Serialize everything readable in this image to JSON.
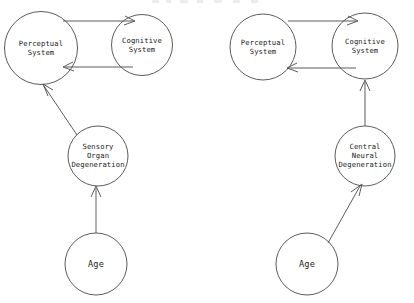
{
  "figure": {
    "type": "diagram",
    "stroke_color": "#4a4a4a",
    "text_color": "#1a1a1a",
    "background_color": "#ffffff"
  },
  "diagrams": [
    {
      "id": "left-model",
      "name": "sensory-organ-degeneration-model",
      "nodes": [
        {
          "id": "left-perceptual",
          "label": "Perceptual\nSystem",
          "cx": 41,
          "cy": 48,
          "r": 36.5,
          "font": "small"
        },
        {
          "id": "left-cognitive",
          "label": "Cognitive\nSystem",
          "cx": 142,
          "cy": 45,
          "r": 30.5,
          "font": "small"
        },
        {
          "id": "left-degeneration",
          "label": "Sensory\nOrgan\nDegeneration",
          "cx": 98,
          "cy": 156,
          "r": 30,
          "font": "small"
        },
        {
          "id": "left-age",
          "label": "Age",
          "cx": 96,
          "cy": 264,
          "r": 31,
          "font": "big"
        }
      ],
      "edges": [
        {
          "id": "left-perceptual-to-cognitive",
          "from": "left-perceptual",
          "to": "left-cognitive",
          "style": "curved",
          "direction": "right"
        },
        {
          "id": "left-cognitive-to-perceptual",
          "from": "left-cognitive",
          "to": "left-perceptual",
          "style": "curved",
          "direction": "left"
        },
        {
          "id": "left-degeneration-to-perceptual",
          "from": "left-degeneration",
          "to": "left-perceptual",
          "style": "diagonal",
          "direction": "up-left"
        },
        {
          "id": "left-age-to-degeneration",
          "from": "left-age",
          "to": "left-degeneration",
          "style": "straight",
          "direction": "up"
        }
      ]
    },
    {
      "id": "right-model",
      "name": "central-neural-degeneration-model",
      "nodes": [
        {
          "id": "right-perceptual",
          "label": "Perceptual\nSystem",
          "cx": 263,
          "cy": 47,
          "r": 33,
          "font": "small"
        },
        {
          "id": "right-cognitive",
          "label": "Cognitive\nSystem",
          "cx": 365,
          "cy": 46,
          "r": 33,
          "font": "small"
        },
        {
          "id": "right-degeneration",
          "label": "Central\nNeural\nDegeneration",
          "cx": 365,
          "cy": 156,
          "r": 30,
          "font": "small"
        },
        {
          "id": "right-age",
          "label": "Age",
          "cx": 307,
          "cy": 264,
          "r": 31,
          "font": "big"
        }
      ],
      "edges": [
        {
          "id": "right-perceptual-to-cognitive",
          "from": "right-perceptual",
          "to": "right-cognitive",
          "style": "curved",
          "direction": "right"
        },
        {
          "id": "right-cognitive-to-perceptual",
          "from": "right-cognitive",
          "to": "right-perceptual",
          "style": "curved",
          "direction": "left"
        },
        {
          "id": "right-degeneration-to-cognitive",
          "from": "right-degeneration",
          "to": "right-cognitive",
          "style": "straight",
          "direction": "up"
        },
        {
          "id": "right-age-to-degeneration",
          "from": "right-age",
          "to": "right-degeneration",
          "style": "diagonal",
          "direction": "up-right"
        }
      ]
    }
  ]
}
